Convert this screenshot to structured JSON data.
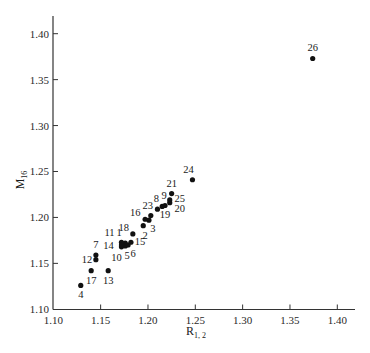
{
  "chart_data": {
    "type": "scatter",
    "title": "",
    "xlabel": "R",
    "xlabel_sub": "1, 2",
    "ylabel": "M",
    "ylabel_sub": "16",
    "xlim": [
      1.1,
      1.42
    ],
    "ylim": [
      1.1,
      1.42
    ],
    "xticks": [
      "1.10",
      "1.15",
      "1.20",
      "1.25",
      "1.30",
      "1.35",
      "1.40"
    ],
    "yticks": [
      "1.10",
      "1.15",
      "1.20",
      "1.25",
      "1.30",
      "1.35",
      "1.40"
    ],
    "grid": false,
    "legend": null,
    "points": [
      {
        "label": "1",
        "x": 1.176,
        "y": 1.172,
        "lx": -6,
        "ly": -7
      },
      {
        "label": "2",
        "x": 1.195,
        "y": 1.191,
        "lx": 2,
        "ly": 13
      },
      {
        "label": "3",
        "x": 1.201,
        "y": 1.197,
        "lx": 4,
        "ly": 12
      },
      {
        "label": "4",
        "x": 1.129,
        "y": 1.126,
        "lx": 0,
        "ly": 13
      },
      {
        "label": "5",
        "x": 1.176,
        "y": 1.169,
        "lx": 2,
        "ly": 13
      },
      {
        "label": "6",
        "x": 1.179,
        "y": 1.17,
        "lx": 5,
        "ly": 12
      },
      {
        "label": "7",
        "x": 1.145,
        "y": 1.159,
        "lx": 0,
        "ly": -7
      },
      {
        "label": "8",
        "x": 1.21,
        "y": 1.209,
        "lx": -1,
        "ly": -7
      },
      {
        "label": "9",
        "x": 1.215,
        "y": 1.212,
        "lx": 2,
        "ly": -7
      },
      {
        "label": "10",
        "x": 1.172,
        "y": 1.168,
        "lx": -5,
        "ly": 14
      },
      {
        "label": "11",
        "x": 1.172,
        "y": 1.173,
        "lx": -12,
        "ly": -6
      },
      {
        "label": "12",
        "x": 1.145,
        "y": 1.154,
        "lx": -9,
        "ly": 3
      },
      {
        "label": "13",
        "x": 1.158,
        "y": 1.142,
        "lx": 0,
        "ly": 13
      },
      {
        "label": "14",
        "x": 1.172,
        "y": 1.17,
        "lx": -13,
        "ly": 4
      },
      {
        "label": "15",
        "x": 1.182,
        "y": 1.173,
        "lx": 9,
        "ly": 3
      },
      {
        "label": "16",
        "x": 1.197,
        "y": 1.198,
        "lx": -10,
        "ly": -3
      },
      {
        "label": "17",
        "x": 1.14,
        "y": 1.142,
        "lx": 0,
        "ly": 13
      },
      {
        "label": "18",
        "x": 1.184,
        "y": 1.182,
        "lx": -9,
        "ly": -3
      },
      {
        "label": "19",
        "x": 1.218,
        "y": 1.213,
        "lx": 0,
        "ly": 13
      },
      {
        "label": "20",
        "x": 1.223,
        "y": 1.216,
        "lx": 10,
        "ly": 9
      },
      {
        "label": "21",
        "x": 1.225,
        "y": 1.226,
        "lx": 0,
        "ly": -7
      },
      {
        "label": "23",
        "x": 1.203,
        "y": 1.202,
        "lx": -3,
        "ly": -7
      },
      {
        "label": "24",
        "x": 1.247,
        "y": 1.241,
        "lx": -4,
        "ly": -7
      },
      {
        "label": "25",
        "x": 1.223,
        "y": 1.219,
        "lx": 10,
        "ly": 2
      },
      {
        "label": "26",
        "x": 1.374,
        "y": 1.373,
        "lx": 0,
        "ly": -7
      }
    ]
  }
}
